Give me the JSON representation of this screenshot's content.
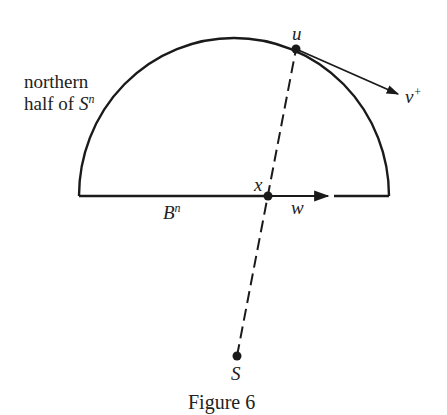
{
  "labels": {
    "region": "northern",
    "region2": "half of ",
    "sphere": "S",
    "sphere_sup": "n",
    "u": "u",
    "v": "v",
    "v_sup": "+",
    "x": "x",
    "w": "w",
    "ball": "B",
    "ball_sup": "n",
    "s": "S"
  },
  "caption": "Figure 6",
  "colors": {
    "stroke": "#1a1a1a",
    "background": "#ffffff"
  }
}
